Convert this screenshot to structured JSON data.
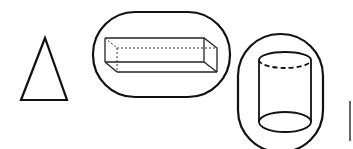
{
  "figure": {
    "colors": {
      "stroke": "#111111",
      "background": "#ffffff"
    },
    "shapes": [
      {
        "id": "triangle",
        "label": "triangle"
      },
      {
        "id": "rectangular-prism",
        "label": "rectangular prism",
        "enclosed": true
      },
      {
        "id": "cylinder",
        "label": "cylinder",
        "enclosed": true
      }
    ]
  }
}
